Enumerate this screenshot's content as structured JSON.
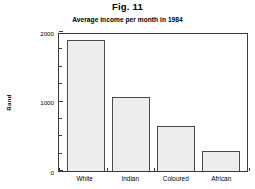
{
  "figure": {
    "caption": "Fig. 11"
  },
  "chart_data": {
    "type": "bar",
    "title": "Average income per month in 1984",
    "xlabel": "",
    "ylabel": "Rand",
    "categories": [
      "White",
      "Indian",
      "Coloured",
      "African"
    ],
    "values": [
      1880,
      1060,
      650,
      290
    ],
    "ylim": [
      0,
      2000
    ],
    "ytick_labels": [
      "0",
      "1000",
      "2000"
    ],
    "ytick_values": [
      0,
      1000,
      2000
    ],
    "yminor_tick_values": [
      250,
      500,
      750,
      1250,
      1500,
      1750
    ],
    "grid": false,
    "legend": false,
    "bar_fill_color": "#ededed",
    "bar_edge_color": "#4a4a4a",
    "axis_color": "#3a3a3a"
  }
}
